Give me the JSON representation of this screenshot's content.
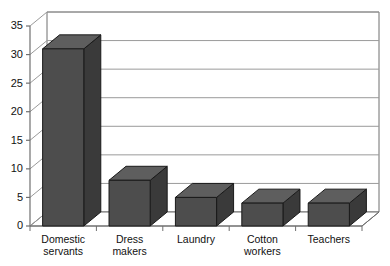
{
  "chart_data": {
    "type": "bar",
    "title": "",
    "subtitle": "",
    "xlabel": "",
    "ylabel": "",
    "categories": [
      "Domestic servants",
      "Dress makers",
      "Laundry",
      "Cotton workers",
      "Teachers"
    ],
    "category_lines": [
      [
        "Domestic",
        "servants"
      ],
      [
        "Dress",
        "makers"
      ],
      [
        "Laundry"
      ],
      [
        "Cotton",
        "workers"
      ],
      [
        "Teachers"
      ]
    ],
    "values": [
      31,
      8,
      5,
      4,
      4
    ],
    "ylim": [
      0,
      35
    ],
    "ytick_values": [
      0,
      5,
      10,
      15,
      20,
      25,
      30,
      35
    ],
    "ytick_labels": [
      "0",
      "5",
      "10",
      "15",
      "20",
      "25",
      "30",
      "35"
    ],
    "grid": true,
    "grid_axis": "y",
    "legend": false,
    "legend_position": "none",
    "style": "3d-column",
    "bar_front_color": "#4d4d4d",
    "bar_top_color": "#5e5e5e",
    "bar_side_color": "#3a3a3a",
    "bar_edge_color": "#1a1a1a",
    "grid_color": "#9a9a9a",
    "axis_color": "#6f6f6f",
    "plot_background": "#ffffff",
    "page_background": "#ffffff"
  }
}
